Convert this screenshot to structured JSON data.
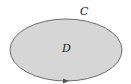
{
  "diagram": {
    "region_label": "D",
    "curve_label": "C",
    "colors": {
      "fill": "#d6d6d6",
      "stroke": "#6e6e6e",
      "text": "#222222",
      "arrow": "#555555"
    }
  }
}
